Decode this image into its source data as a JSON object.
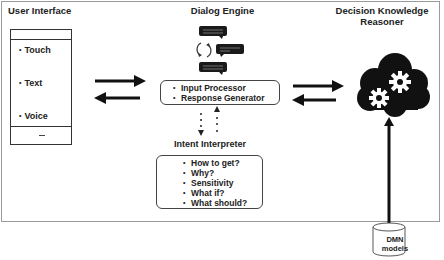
{
  "sections": {
    "user_interface": {
      "title": "User Interface",
      "modalities": [
        "Touch",
        "Text",
        "Voice"
      ],
      "bottom_bar_glyph": "—"
    },
    "dialog_engine": {
      "title": "Dialog Engine",
      "icons": [
        "chat-bubble-icon",
        "refresh-cycle-icon",
        "chat-bubble-icon",
        "chat-bubble-icon"
      ],
      "components": [
        "Input Processor",
        "Response Generator"
      ]
    },
    "intent_interpreter": {
      "title": "Intent Interpreter",
      "intents": [
        "How to get?",
        "Why?",
        "Sensitivity",
        "What if?",
        "What should?"
      ]
    },
    "decision_knowledge_reasoner": {
      "title_line1": "Decision Knowledge",
      "title_line2": "Reasoner",
      "icon": "cloud-gears-icon"
    },
    "dmn_models": {
      "line1": "DMN",
      "line2": "models",
      "icon": "database-cylinder-icon"
    }
  },
  "bullet": "•",
  "connections": [
    {
      "from": "user_interface",
      "to": "dialog_engine",
      "type": "bidirectional-arrows"
    },
    {
      "from": "dialog_engine",
      "to": "decision_knowledge_reasoner",
      "type": "bidirectional-arrows"
    },
    {
      "from": "dialog_engine",
      "to": "intent_interpreter",
      "type": "dotted-bidirectional"
    },
    {
      "from": "dmn_models",
      "to": "decision_knowledge_reasoner",
      "type": "arrow-up"
    }
  ]
}
